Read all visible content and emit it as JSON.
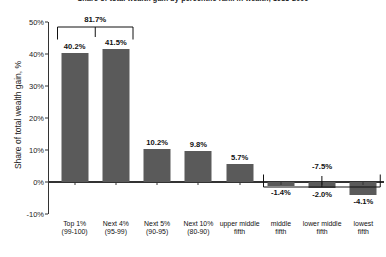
{
  "chart_data": {
    "type": "bar",
    "title": "Share of total wealth gain by percentile rank in wealth, 1983-2009",
    "xlabel": "",
    "ylabel": "Share of total wealth gain, %",
    "ylim": [
      -10,
      50
    ],
    "grid": false,
    "legend": "none",
    "bar_color": "#5a5a5a",
    "categories": [
      "Top 1%\n(99-100)",
      "Next 4%\n(95-99)",
      "Next 5%\n(90-95)",
      "Next 10%\n(80-90)",
      "upper middle\nfifth",
      "middle\nfifth",
      "lower middle\nfifth",
      "lowest\nfifth"
    ],
    "values": [
      40.2,
      41.5,
      10.2,
      9.8,
      5.7,
      -1.4,
      -2.0,
      -4.1
    ],
    "data_labels": [
      "40.2%",
      "41.5%",
      "10.2%",
      "9.8%",
      "5.7%",
      "-1.4%",
      "-2.0%",
      "-4.1%"
    ],
    "ytick_labels": [
      "50%",
      "40%",
      "30%",
      "20%",
      "10%",
      "0%",
      "-10%"
    ],
    "ytick_values": [
      50,
      40,
      30,
      20,
      10,
      0,
      -10
    ],
    "annotations": [
      {
        "label": "81.7%",
        "value": 81.7,
        "spans": [
          "Top 1%\n(99-100)",
          "Next 4%\n(95-99)"
        ],
        "style": "bracket-down"
      },
      {
        "label": "-7.5%",
        "value": -7.5,
        "spans": [
          "middle\nfifth",
          "lower middle\nfifth",
          "lowest\nfifth"
        ],
        "style": "bracket-up"
      }
    ]
  },
  "labels": {
    "cat0_line1": "Top 1%",
    "cat0_line2": "(99-100)",
    "cat1_line1": "Next 4%",
    "cat1_line2": "(95-99)",
    "cat2_line1": "Next 5%",
    "cat2_line2": "(90-95)",
    "cat3_line1": "Next 10%",
    "cat3_line2": "(80-90)",
    "cat4_line1": "upper middle",
    "cat4_line2": "fifth",
    "cat5_line1": "middle",
    "cat5_line2": "fifth",
    "cat6_line1": "lower middle",
    "cat6_line2": "fifth",
    "cat7_line1": "lowest",
    "cat7_line2": "fifth"
  }
}
